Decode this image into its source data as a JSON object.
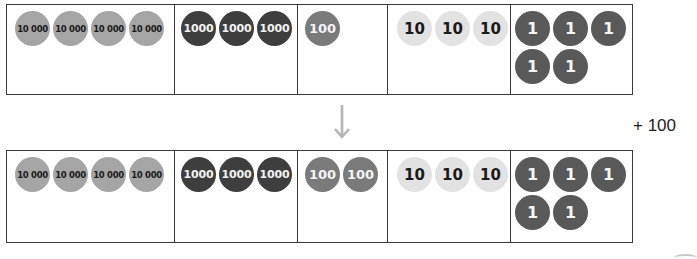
{
  "diagram": {
    "before": {
      "columns": [
        {
          "place": "ten-thousands",
          "coin_label": "10 000",
          "count": 4,
          "coins": [
            "10 000",
            "10 000",
            "10 000",
            "10 000"
          ]
        },
        {
          "place": "thousands",
          "coin_label": "1000",
          "count": 3,
          "coins": [
            "1000",
            "1000",
            "1000"
          ]
        },
        {
          "place": "hundreds",
          "coin_label": "100",
          "count": 1,
          "coins": [
            "100"
          ]
        },
        {
          "place": "tens",
          "coin_label": "10",
          "count": 3,
          "coins": [
            "10",
            "10",
            "10"
          ]
        },
        {
          "place": "ones",
          "coin_label": "1",
          "count": 5,
          "coins": [
            "1",
            "1",
            "1",
            "1",
            "1"
          ]
        }
      ]
    },
    "operation": {
      "label": "+ 100",
      "arrow": "down-arrow"
    },
    "after": {
      "columns": [
        {
          "place": "ten-thousands",
          "coin_label": "10 000",
          "count": 4,
          "coins": [
            "10 000",
            "10 000",
            "10 000",
            "10 000"
          ]
        },
        {
          "place": "thousands",
          "coin_label": "1000",
          "count": 3,
          "coins": [
            "1000",
            "1000",
            "1000"
          ]
        },
        {
          "place": "hundreds",
          "coin_label": "100",
          "count": 2,
          "coins": [
            "100",
            "100"
          ]
        },
        {
          "place": "tens",
          "coin_label": "10",
          "count": 3,
          "coins": [
            "10",
            "10",
            "10"
          ]
        },
        {
          "place": "ones",
          "coin_label": "1",
          "count": 5,
          "coins": [
            "1",
            "1",
            "1",
            "1",
            "1"
          ]
        }
      ]
    },
    "colors": {
      "ten_thousand_coin": "#a5a5a5",
      "thousand_coin": "#3e3e3e",
      "hundred_coin": "#7a7a7a",
      "ten_coin": "#e2e2e2",
      "one_coin": "#595959",
      "arrow": "#b5b5b5",
      "border": "#3a3a3a"
    }
  }
}
